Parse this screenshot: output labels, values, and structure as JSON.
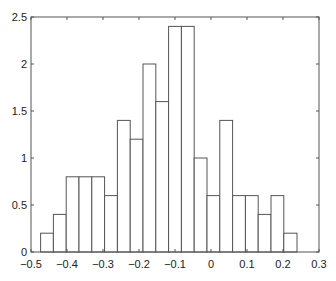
{
  "chart_data": {
    "type": "bar",
    "title": "",
    "xlabel": "",
    "ylabel": "",
    "xlim": [
      -0.5,
      0.3
    ],
    "ylim": [
      0,
      2.5
    ],
    "grid": false,
    "legend": null,
    "bin_edges": [
      -0.4733,
      -0.4378,
      -0.4022,
      -0.3667,
      -0.3311,
      -0.2956,
      -0.26,
      -0.2244,
      -0.1889,
      -0.1533,
      -0.1178,
      -0.0822,
      -0.0467,
      -0.0111,
      0.0244,
      0.06,
      0.0956,
      0.1311,
      0.1667,
      0.2022,
      0.2389
    ],
    "categories": [
      "-0.456",
      "-0.420",
      "-0.384",
      "-0.349",
      "-0.313",
      "-0.278",
      "-0.242",
      "-0.207",
      "-0.171",
      "-0.136",
      "-0.100",
      "-0.064",
      "-0.029",
      "0.007",
      "0.042",
      "0.078",
      "0.113",
      "0.149",
      "0.184",
      "0.221"
    ],
    "values": [
      0.2,
      0.4,
      0.8,
      0.8,
      0.8,
      0.6,
      1.4,
      1.2,
      2.0,
      1.6,
      2.4,
      2.4,
      1.0,
      0.6,
      1.4,
      0.6,
      0.6,
      0.4,
      0.6,
      0.2
    ],
    "xticks": [
      "-0.5",
      "-0.4",
      "-0.3",
      "-0.2",
      "-0.1",
      "0",
      "0.1",
      "0.2",
      "0.3"
    ],
    "xtick_values": [
      -0.5,
      -0.4,
      -0.3,
      -0.2,
      -0.1,
      0,
      0.1,
      0.2,
      0.3
    ],
    "yticks": [
      "0",
      "0.5",
      "1",
      "1.5",
      "2",
      "2.5"
    ],
    "ytick_values": [
      0,
      0.5,
      1,
      1.5,
      2,
      2.5
    ],
    "colors": {
      "bar_fill": "#ffffff",
      "bar_edge": "#555555",
      "axis": "#555555"
    }
  }
}
